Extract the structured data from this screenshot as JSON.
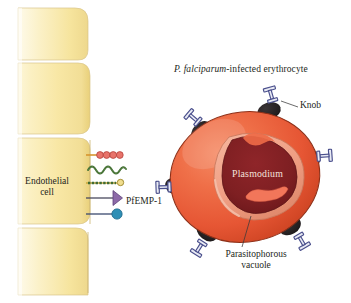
{
  "figure": {
    "name": "P. falciparum-infected erythrocyte cytoadherence diagram",
    "background_color": "#ffffff",
    "width": 351,
    "height": 303
  },
  "title": {
    "italic_part": "P. falciparum",
    "roman_part": "-infected erythrocyte",
    "full": "P. falciparum-infected erythrocyte"
  },
  "endothelium": {
    "label": "Endothelial\ncell",
    "label_line1": "Endothelial",
    "label_line2": "cell",
    "fill_light": "#fdf3cd",
    "fill_mid": "#f7e49a",
    "fill_edge": "#e8d27a",
    "cell_count": 4
  },
  "receptors": [
    {
      "name": "beaded-chain-receptor",
      "shape": "four-bead-chain",
      "color": "#e8736a",
      "outline": "#b5433c",
      "stalk_color": "#d8952f",
      "bead_count": 4
    },
    {
      "name": "wavy-fiber-receptor",
      "shape": "wavy-fiber",
      "color": "#3f6b33",
      "outline": "#2e5227",
      "stalk_color": "#3f6b33"
    },
    {
      "name": "dashed-stalk-knob-receptor",
      "shape": "segmented-stalk-with-small-sphere",
      "color": "#3f6b33",
      "tip_color": "#e8d27a",
      "tip_outline": "#9a8428",
      "stalk_color": "#c8a93a"
    },
    {
      "name": "triangle-receptor",
      "shape": "left-pointing-triangle",
      "color": "#8d6aa8",
      "outline": "#5d4278",
      "stalk_color": "#4a4a5e"
    },
    {
      "name": "sphere-receptor",
      "shape": "circle",
      "color": "#2f8fb5",
      "outline": "#1d6a8c",
      "stalk_color": "#3a4a6e"
    }
  ],
  "erythrocyte": {
    "name": "infected red blood cell",
    "fill_light": "#f2745a",
    "fill_mid": "#e85c3c",
    "fill_dark": "#d14a2c",
    "outline": "#7a2a18",
    "knob_color": "#231f20",
    "knob_count": 6
  },
  "pfemp1": {
    "label": "PfEMP-1",
    "color": "#4a4f8c",
    "fill": "#e8eaf4",
    "count": 6,
    "shape": "I-beam transmembrane protein"
  },
  "knob": {
    "label": "Knob",
    "color": "#231f20"
  },
  "plasmodium": {
    "label": "Plasmodium",
    "fill_dark": "#7d1f22",
    "fill_mid": "#8e2427",
    "text_color": "#f6e3dd"
  },
  "vacuole": {
    "label": "Parasitophorous\nvacuole",
    "label_line1": "Parasitophorous",
    "label_line2": "vacuole",
    "fill": "#f0a289",
    "outline": "#c9795e"
  },
  "leader_lines": {
    "color": "#3a3a3a"
  }
}
